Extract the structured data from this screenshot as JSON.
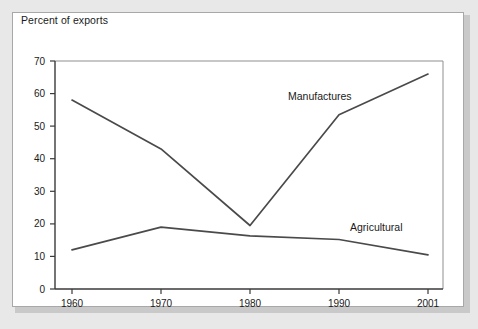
{
  "figure": {
    "title": "Percent of exports"
  },
  "chart_data": {
    "type": "line",
    "title": "Percent of exports",
    "xlabel": "",
    "ylabel": "Percent of exports",
    "x": [
      1960,
      1970,
      1980,
      1990,
      2001
    ],
    "categories": [
      "1960",
      "1970",
      "1980",
      "1990",
      "2001"
    ],
    "series": [
      {
        "name": "Manufactures",
        "values": [
          58,
          43,
          19.5,
          53.5,
          66
        ]
      },
      {
        "name": "Agricultural",
        "values": [
          12,
          19,
          16.3,
          15.2,
          10.5
        ]
      }
    ],
    "ylim": [
      0,
      70
    ],
    "yticks": [
      0,
      10,
      20,
      30,
      40,
      50,
      60,
      70
    ],
    "ytick_labels": [
      "0",
      "10",
      "20",
      "30",
      "40",
      "50",
      "60",
      "70"
    ],
    "xticks": [
      1960,
      1970,
      1980,
      1990,
      2001
    ],
    "xtick_labels": [
      "1960",
      "1970",
      "1980",
      "1990",
      "2001"
    ],
    "grid": false,
    "legend": "inline-labels",
    "annotations": [
      {
        "text": "Manufactures",
        "x": 1983.5,
        "y": 56.5
      },
      {
        "text": "Agricultural",
        "x": 1993.0,
        "y": 20.0
      }
    ],
    "line_color": "#4a4a4a",
    "axis_color": "#3a3a3a"
  }
}
